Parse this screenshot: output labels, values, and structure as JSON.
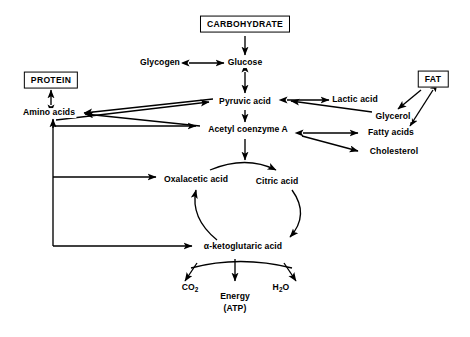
{
  "diagram": {
    "type": "flow-diagram",
    "background_color": "#ffffff",
    "line_color": "#000000",
    "text_color": "#000000",
    "nodes": {
      "carbohydrate": {
        "label": "CARBOHYDRATE",
        "style": "boxed",
        "x": 245,
        "y": 24
      },
      "glucose": {
        "label": "Glucose",
        "style": "plain",
        "x": 245,
        "y": 63
      },
      "glycogen": {
        "label": "Glycogen",
        "style": "plain",
        "x": 160,
        "y": 63
      },
      "pyruvic_acid": {
        "label": "Pyruvic acid",
        "style": "plain",
        "x": 245,
        "y": 102
      },
      "lactic_acid": {
        "label": "Lactic acid",
        "style": "plain",
        "x": 355,
        "y": 100
      },
      "protein": {
        "label": "PROTEIN",
        "style": "boxed",
        "x": 51,
        "y": 80
      },
      "amino_acids": {
        "label": "Amino acids",
        "style": "plain",
        "x": 49,
        "y": 113
      },
      "fat": {
        "label": "FAT",
        "style": "boxed",
        "x": 433,
        "y": 79
      },
      "glycerol": {
        "label": "Glycerol",
        "style": "plain",
        "x": 393,
        "y": 117
      },
      "fatty_acids": {
        "label": "Fatty acids",
        "style": "plain",
        "x": 391,
        "y": 133
      },
      "cholesterol": {
        "label": "Cholesterol",
        "style": "plain",
        "x": 394,
        "y": 152
      },
      "acetyl_coa": {
        "label": "Acetyl coenzyme A",
        "style": "plain",
        "x": 248,
        "y": 130
      },
      "oxalacetic": {
        "label": "Oxalacetic acid",
        "style": "plain",
        "x": 196,
        "y": 180
      },
      "citric_acid": {
        "label": "Citric acid",
        "style": "plain",
        "x": 277,
        "y": 182
      },
      "ketoglutaric": {
        "label": "α-ketoglutaric acid",
        "style": "plain",
        "x": 243,
        "y": 247
      },
      "co2": {
        "label": "CO",
        "sub": "2",
        "style": "plain",
        "x": 190,
        "y": 288
      },
      "h2o": {
        "label": "H",
        "sub": "2",
        "label2": "O",
        "style": "plain",
        "x": 281,
        "y": 288
      },
      "energy": {
        "label": "Energy",
        "label2": "(ATP)",
        "style": "plain",
        "x": 235,
        "y": 303
      }
    },
    "edges": [
      {
        "name": "carbohydrate-to-glucose",
        "from": "carbohydrate",
        "to": "glucose",
        "direction": "one-way"
      },
      {
        "name": "glycogen-glucose",
        "from": "glycogen",
        "to": "glucose",
        "direction": "two-way"
      },
      {
        "name": "glucose-pyruvic",
        "from": "glucose",
        "to": "pyruvic_acid",
        "direction": "two-way"
      },
      {
        "name": "pyruvic-lactic",
        "from": "pyruvic_acid",
        "to": "lactic_acid",
        "direction": "two-way"
      },
      {
        "name": "protein-amino-acids",
        "from": "protein",
        "to": "amino_acids",
        "direction": "two-way"
      },
      {
        "name": "pyruvic-to-amino-acids",
        "from": "pyruvic_acid",
        "to": "amino_acids",
        "direction": "one-way"
      },
      {
        "name": "amino-acids-to-pyruvic",
        "from": "amino_acids",
        "to": "pyruvic_acid",
        "direction": "one-way"
      },
      {
        "name": "acetyl-coa-to-amino-acids",
        "from": "acetyl_coa",
        "to": "amino_acids",
        "direction": "one-way"
      },
      {
        "name": "pyruvic-to-acetyl-coa",
        "from": "pyruvic_acid",
        "to": "acetyl_coa",
        "direction": "one-way"
      },
      {
        "name": "fat-to-glycerol",
        "from": "fat",
        "to": "glycerol",
        "direction": "one-way"
      },
      {
        "name": "fat-fatty-acids",
        "from": "fat",
        "to": "fatty_acids",
        "direction": "two-way"
      },
      {
        "name": "glycerol-to-pyruvic",
        "from": "glycerol",
        "to": "pyruvic_acid",
        "direction": "one-way"
      },
      {
        "name": "acetyl-coa-fatty-acids",
        "from": "acetyl_coa",
        "to": "fatty_acids",
        "direction": "two-way"
      },
      {
        "name": "acetyl-coa-to-cholesterol",
        "from": "acetyl_coa",
        "to": "cholesterol",
        "direction": "one-way"
      },
      {
        "name": "amino-acids-trunk-to-acetyl-coa",
        "from": "amino_acids",
        "to": "acetyl_coa",
        "direction": "one-way"
      },
      {
        "name": "trunk-to-oxalacetic",
        "from": "amino_acids",
        "to": "oxalacetic",
        "direction": "one-way"
      },
      {
        "name": "trunk-to-ketoglutaric",
        "from": "amino_acids",
        "to": "ketoglutaric",
        "direction": "one-way"
      },
      {
        "name": "acetyl-coa-to-cycle",
        "from": "acetyl_coa",
        "to": "citric_acid",
        "direction": "one-way"
      },
      {
        "name": "oxalacetic-to-citric",
        "from": "oxalacetic",
        "to": "citric_acid",
        "direction": "one-way"
      },
      {
        "name": "citric-to-ketoglutaric",
        "from": "citric_acid",
        "to": "ketoglutaric",
        "direction": "one-way"
      },
      {
        "name": "ketoglutaric-to-oxalacetic",
        "from": "ketoglutaric",
        "to": "oxalacetic",
        "direction": "one-way"
      },
      {
        "name": "cycle-to-co2",
        "from": "ketoglutaric",
        "to": "co2",
        "direction": "one-way"
      },
      {
        "name": "cycle-to-energy",
        "from": "ketoglutaric",
        "to": "energy",
        "direction": "one-way"
      },
      {
        "name": "cycle-to-h2o",
        "from": "ketoglutaric",
        "to": "h2o",
        "direction": "one-way"
      }
    ]
  }
}
